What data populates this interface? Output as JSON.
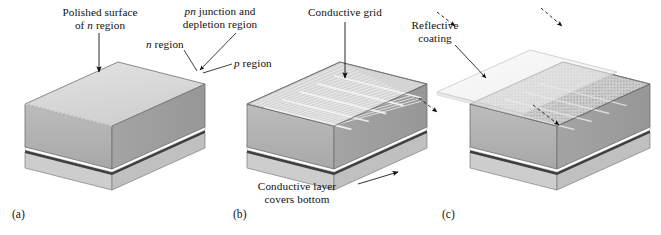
{
  "figure": {
    "background_color": "#ffffff",
    "panels": [
      {
        "id": "a",
        "caption": "(a)",
        "labels": [
          {
            "name": "polished-surface",
            "line1": "Polished surface",
            "line2_pre": "of ",
            "line2_italic": "n",
            "line2_post": " region"
          },
          {
            "name": "n-region",
            "pre": "",
            "italic": "n",
            "post": " region"
          },
          {
            "name": "p-region",
            "pre": "",
            "italic": "p",
            "post": " region"
          }
        ]
      },
      {
        "id": "b",
        "caption": "(b)",
        "labels": [
          {
            "name": "conductive-grid",
            "text": "Conductive grid"
          },
          {
            "name": "conductive-layer",
            "line1": "Conductive layer",
            "line2": "covers bottom"
          }
        ]
      },
      {
        "id": "c",
        "caption": "(c)",
        "labels": [
          {
            "name": "reflective-coating",
            "line1": "Reflective",
            "line2": "coating"
          }
        ]
      }
    ],
    "shared_labels": [
      {
        "name": "pn-junction",
        "line1_italic": "pn",
        "line1_post": " junction and",
        "line2": "depletion region"
      }
    ],
    "colors": {
      "top_face": "#d9d9d9",
      "top_face_grid": "#c9c9c9",
      "front_face_n": "#b2b2b2",
      "right_face_n": "#9d9d9d",
      "p_region_front": "#c6c6c6",
      "p_region_right": "#bdbdbd",
      "junction_white": "#ffffff",
      "junction_dark": "#4a4a4a",
      "bottom_conductor": "#888888",
      "reflective_coating": "#efefef",
      "outline": "#6f6f6f",
      "arrow": "#0d0d0d",
      "text": "#101010"
    }
  }
}
